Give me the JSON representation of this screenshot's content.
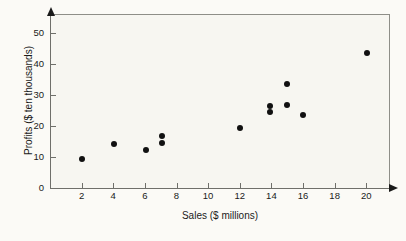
{
  "chart_data": {
    "type": "scatter",
    "title": "",
    "xlabel": "Sales ($ millions)",
    "ylabel": "Profits ($ ten thousands)",
    "xlim": [
      0,
      21.5
    ],
    "ylim": [
      0,
      56
    ],
    "grid": false,
    "legend": null,
    "x_ticks": [
      2,
      4,
      6,
      8,
      10,
      12,
      14,
      16,
      18,
      20
    ],
    "y_ticks": [
      0,
      10,
      20,
      30,
      40,
      50
    ],
    "x_tick_labels": [
      "2",
      "4",
      "6",
      "8",
      "10",
      "12",
      "14",
      "16",
      "18",
      "20"
    ],
    "y_tick_labels": [
      "0",
      "10",
      "20",
      "30",
      "40",
      "50"
    ],
    "marker": "filled-circle",
    "marker_color": "#111111",
    "points": [
      {
        "x": 2.05,
        "y": 9.4
      },
      {
        "x": 4.05,
        "y": 14.2
      },
      {
        "x": 6.1,
        "y": 12.3
      },
      {
        "x": 7.1,
        "y": 16.8
      },
      {
        "x": 7.1,
        "y": 14.5
      },
      {
        "x": 12.0,
        "y": 19.4
      },
      {
        "x": 13.9,
        "y": 26.5
      },
      {
        "x": 13.9,
        "y": 24.3
      },
      {
        "x": 15.0,
        "y": 33.6
      },
      {
        "x": 15.0,
        "y": 26.8
      },
      {
        "x": 16.0,
        "y": 23.6
      },
      {
        "x": 20.05,
        "y": 43.5
      }
    ]
  }
}
